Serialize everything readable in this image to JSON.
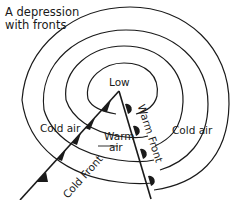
{
  "title_line1": "A depression",
  "title_line2": "with fronts",
  "labels": {
    "low": "Low",
    "cold_air_left": "Cold air",
    "cold_air_right": "Cold air",
    "warm_air_1": "Warm",
    "warm_air_2": "air",
    "cold_front": "Cold Front",
    "warm_front": "Warm Front"
  },
  "colors": {
    "line": "#1a1a1a",
    "background": "#ffffff"
  }
}
